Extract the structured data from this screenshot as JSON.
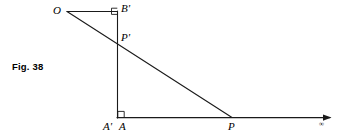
{
  "figure": {
    "caption": "Fig. 38",
    "background_color": "#ffffff",
    "stroke_color": "#1a1a1a",
    "labels": {
      "origin": "O",
      "b_prime": "B'",
      "p_prime": "P'",
      "a_prime": "A'",
      "a": "A",
      "p": "P",
      "infinity": "∞"
    },
    "geometry": {
      "points": {
        "O": [
          67,
          11
        ],
        "B_prime": [
          117,
          11
        ],
        "P_prime": [
          117,
          40
        ],
        "A_prime_A": [
          117,
          118
        ],
        "P": [
          232,
          118
        ],
        "axis_end": [
          332,
          118
        ]
      },
      "segments": [
        {
          "name": "O-B-prime",
          "from": "O",
          "to": "B_prime"
        },
        {
          "name": "O-P-ray",
          "from": "O",
          "to": "P"
        },
        {
          "name": "B-prime-A-prime-vertical",
          "from": "B_prime",
          "to": "A_prime_A"
        },
        {
          "name": "A-to-infinity-axis",
          "from": "A_prime_A",
          "to": "axis_end"
        }
      ],
      "right_angle_markers": [
        {
          "name": "right-angle-at-B-prime",
          "vertex": "B_prime"
        },
        {
          "name": "right-angle-at-A",
          "vertex": "A_prime_A"
        }
      ],
      "arrowheads": [
        {
          "name": "axis-arrowhead",
          "at": "axis_end"
        }
      ]
    }
  }
}
